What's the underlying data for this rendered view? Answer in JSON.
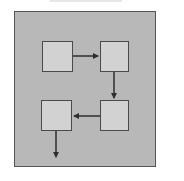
{
  "diagram": {
    "type": "flow",
    "colors": {
      "background": "#ffffff",
      "panel_fill": "#b8b8b8",
      "panel_border": "#555555",
      "node_fill": "#d2d2d2",
      "node_border": "#4a4a4a",
      "arrow": "#2e2e2e"
    },
    "nodes": [
      {
        "id": "box-1",
        "label": "",
        "x": 42,
        "y": 41,
        "w": 30,
        "h": 30
      },
      {
        "id": "box-2",
        "label": "",
        "x": 100,
        "y": 41,
        "w": 28,
        "h": 30
      },
      {
        "id": "box-3",
        "label": "",
        "x": 100,
        "y": 100,
        "w": 28,
        "h": 30
      },
      {
        "id": "box-4",
        "label": "",
        "x": 41,
        "y": 100,
        "w": 30,
        "h": 30
      }
    ],
    "edges": [
      {
        "from": "box-1",
        "to": "box-2",
        "direction": "right"
      },
      {
        "from": "box-2",
        "to": "box-3",
        "direction": "down"
      },
      {
        "from": "box-3",
        "to": "box-4",
        "direction": "left"
      },
      {
        "from": "box-4",
        "to": "exit",
        "direction": "down"
      }
    ]
  }
}
